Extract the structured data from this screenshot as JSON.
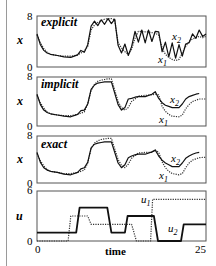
{
  "chart_data": [
    {
      "type": "line",
      "panel": "explicit",
      "title": "explicit",
      "ylabel": "x",
      "yticks": [
        "8",
        "0"
      ],
      "ylim": [
        0,
        8
      ],
      "xlim": [
        0,
        25
      ],
      "series": [
        {
          "name": "x1",
          "style": "dotted",
          "x": [
            0,
            0.5,
            1,
            1.5,
            2,
            3,
            4,
            5,
            6,
            7,
            7.5,
            8,
            8.5,
            9,
            9.5,
            10,
            10.5,
            11,
            11.5,
            12,
            12.5,
            13,
            13.5,
            14,
            14.5,
            15,
            15.5,
            16,
            16.5,
            17,
            17.5,
            18,
            18.5,
            19,
            19.5,
            20,
            20.5,
            21,
            21.5,
            22,
            22.5,
            23,
            23.5,
            24,
            24.5,
            25
          ],
          "y": [
            5,
            3.8,
            2.9,
            2.3,
            2.0,
            1.8,
            1.7,
            1.7,
            1.9,
            2.5,
            3.2,
            5.8,
            6.6,
            7.0,
            7.3,
            7.5,
            7.6,
            7.6,
            7.4,
            3.8,
            3.0,
            2.4,
            2.0,
            2.8,
            4.5,
            5.6,
            5.6,
            5.5,
            5.5,
            5.4,
            5.3,
            5.0,
            3.0,
            2.0,
            1.5,
            1.2,
            1.0,
            1.2,
            2.2,
            3.2,
            4.0,
            4.4,
            4.6,
            4.8,
            4.6,
            4.8
          ]
        },
        {
          "name": "x2",
          "style": "solid",
          "x": [
            0,
            0.5,
            1,
            1.5,
            2,
            3,
            4,
            5,
            6,
            6.5,
            7,
            7.5,
            8,
            8.5,
            9,
            9.5,
            10,
            10.5,
            11,
            11.5,
            12,
            12.5,
            13,
            13.5,
            14,
            14.5,
            15,
            15.5,
            16,
            16.5,
            17,
            17.5,
            18,
            18.5,
            19,
            19.5,
            20,
            20.5,
            21,
            21.5,
            22,
            22.5,
            23,
            23.5,
            24,
            24.5,
            25
          ],
          "y": [
            5.2,
            3.5,
            2.6,
            2.2,
            2.0,
            1.8,
            1.6,
            1.5,
            1.9,
            2.6,
            2.3,
            3.5,
            6.4,
            7.2,
            6.5,
            7.4,
            6.7,
            7.6,
            6.8,
            7.5,
            3.4,
            2.2,
            3.6,
            1.8,
            3.2,
            5.6,
            3.9,
            5.8,
            3.8,
            5.8,
            4.0,
            5.6,
            5.5,
            2.4,
            3.9,
            1.6,
            3.8,
            1.4,
            3.5,
            1.7,
            3.6,
            3.8,
            5.2,
            4.5,
            5.8,
            4.8,
            5.2
          ]
        }
      ],
      "annotations": [
        "x2",
        "x1"
      ]
    },
    {
      "type": "line",
      "panel": "implicit",
      "title": "implicit",
      "ylabel": "x",
      "yticks": [
        "8",
        "0"
      ],
      "ylim": [
        0,
        8
      ],
      "xlim": [
        0,
        25
      ],
      "series": [
        {
          "name": "x1",
          "style": "dotted",
          "x": [
            0,
            0.5,
            1,
            1.5,
            2,
            3,
            4,
            5,
            6,
            7,
            7.5,
            8,
            8.5,
            9,
            9.5,
            10,
            10.5,
            11,
            12,
            12.5,
            13,
            13.5,
            14,
            14.5,
            15,
            16,
            17,
            17.5,
            18,
            18.5,
            19,
            19.5,
            20,
            21,
            21.5,
            22,
            22.5,
            23,
            23.5,
            24,
            25
          ],
          "y": [
            5,
            3.8,
            2.9,
            2.3,
            2.0,
            1.8,
            1.7,
            1.7,
            1.9,
            2.3,
            3.6,
            5.8,
            6.8,
            7.3,
            7.5,
            7.6,
            7.7,
            7.7,
            4.0,
            3.0,
            2.6,
            3.0,
            4.0,
            4.4,
            4.9,
            5.0,
            5.1,
            5.2,
            5.1,
            3.2,
            2.4,
            1.9,
            1.6,
            1.5,
            1.8,
            2.8,
            3.5,
            4.0,
            4.2,
            4.4,
            4.4
          ]
        },
        {
          "name": "x2",
          "style": "solid",
          "x": [
            0,
            0.5,
            1,
            1.5,
            2,
            3,
            4,
            5,
            6,
            6.5,
            7,
            7.5,
            8,
            8.5,
            9,
            9.5,
            10,
            10.5,
            11,
            12,
            12.5,
            13,
            13.5,
            14,
            14.5,
            15,
            16,
            17,
            17.5,
            18,
            18.5,
            19,
            19.5,
            20,
            21,
            21.5,
            22,
            22.5,
            23,
            23.5,
            24,
            25
          ],
          "y": [
            5.2,
            3.5,
            2.6,
            2.2,
            2.0,
            1.8,
            1.6,
            1.5,
            1.9,
            2.5,
            2.6,
            3.6,
            6.0,
            6.7,
            7.0,
            7.1,
            7.2,
            7.2,
            7.2,
            3.5,
            2.6,
            3.0,
            4.4,
            4.5,
            4.7,
            4.8,
            4.8,
            5.2,
            5.6,
            4.5,
            3.8,
            3.4,
            3.2,
            3.0,
            3.0,
            3.6,
            4.4,
            4.8,
            5.0,
            5.2,
            5.3
          ]
        }
      ],
      "annotations": [
        "x2",
        "x1"
      ]
    },
    {
      "type": "line",
      "panel": "exact",
      "title": "exact",
      "ylabel": "x",
      "yticks": [
        "8",
        "0"
      ],
      "ylim": [
        0,
        8
      ],
      "xlim": [
        0,
        25
      ],
      "series": [
        {
          "name": "x1",
          "style": "dotted",
          "x": [
            0,
            0.5,
            1,
            1.5,
            2,
            3,
            4,
            5,
            6,
            7,
            7.5,
            8,
            8.5,
            9,
            9.5,
            10,
            10.5,
            11,
            12,
            12.5,
            13,
            13.5,
            14,
            14.5,
            15,
            16,
            17,
            17.5,
            18,
            18.5,
            19,
            19.5,
            20,
            21,
            21.5,
            22,
            22.5,
            23,
            23.5,
            24,
            25
          ],
          "y": [
            5,
            3.8,
            2.9,
            2.3,
            2.0,
            1.8,
            1.6,
            1.6,
            1.8,
            2.2,
            3.4,
            5.8,
            6.8,
            7.2,
            7.4,
            7.5,
            7.6,
            7.6,
            4.0,
            3.0,
            2.6,
            3.2,
            4.2,
            4.7,
            5.1,
            5.2,
            5.2,
            5.6,
            5.2,
            3.6,
            2.6,
            2.0,
            1.6,
            1.4,
            1.6,
            2.6,
            3.4,
            3.9,
            4.1,
            4.3,
            4.4
          ]
        },
        {
          "name": "x2",
          "style": "solid",
          "x": [
            0,
            0.5,
            1,
            1.5,
            2,
            3,
            4,
            5,
            6,
            6.5,
            7,
            7.5,
            8,
            8.5,
            9,
            9.5,
            10,
            10.5,
            11,
            12,
            12.5,
            13,
            13.5,
            14,
            14.5,
            15,
            16,
            17,
            17.5,
            18,
            18.5,
            19,
            19.5,
            20,
            21,
            21.5,
            22,
            22.5,
            23,
            23.5,
            24,
            25
          ],
          "y": [
            5.2,
            3.5,
            2.6,
            2.2,
            2.0,
            1.8,
            1.5,
            1.4,
            1.8,
            2.4,
            2.6,
            3.5,
            6.0,
            6.6,
            6.8,
            6.9,
            7.0,
            7.0,
            7.0,
            3.4,
            2.6,
            3.1,
            4.3,
            4.6,
            4.8,
            4.9,
            4.9,
            5.3,
            5.6,
            4.6,
            3.9,
            3.4,
            3.1,
            2.8,
            2.8,
            3.4,
            4.2,
            4.6,
            4.9,
            5.1,
            5.2
          ]
        }
      ],
      "annotations": [
        "x2",
        "x1"
      ]
    },
    {
      "type": "line",
      "panel": "controls",
      "title": "",
      "ylabel": "u",
      "xlabel": "time",
      "yticks": [
        "6",
        "0"
      ],
      "xticks": [
        "0",
        "25"
      ],
      "ylim": [
        0,
        6
      ],
      "xlim": [
        0,
        25
      ],
      "series": [
        {
          "name": "u1",
          "style": "dotted",
          "x": [
            0,
            4.4,
            4.6,
            5.0,
            7.5,
            8.0,
            11.5,
            14.0,
            14.7,
            16.6,
            16.8,
            17.1,
            17.6,
            25
          ],
          "y": [
            0,
            0,
            0,
            3.0,
            3.0,
            2.0,
            2.0,
            2.0,
            0,
            0,
            0,
            5.0,
            5.0,
            5.0
          ]
        },
        {
          "name": "u2",
          "style": "solid",
          "x": [
            0,
            5.8,
            6.3,
            10.4,
            11.0,
            13.0,
            13.4,
            17.3,
            17.9,
            21.3,
            21.7,
            25
          ],
          "y": [
            1.0,
            1.0,
            4.0,
            4.0,
            1.0,
            1.0,
            3.0,
            3.0,
            0,
            0,
            2.0,
            2.0
          ]
        }
      ],
      "annotations": [
        "u1",
        "u2"
      ]
    }
  ],
  "labels": {
    "panel1_title": "explicit",
    "panel2_title": "implicit",
    "panel3_title": "exact",
    "x_axis_ylabel": "x",
    "u_axis_ylabel": "u",
    "ytick_top_x": "8",
    "ytick_bottom": "0",
    "ytick_top_u": "6",
    "xtick_start": "0",
    "xtick_end": "25",
    "xlabel": "time",
    "x1_sub": "1",
    "x2_sub": "2",
    "x_letter": "x",
    "u_letter": "u"
  }
}
